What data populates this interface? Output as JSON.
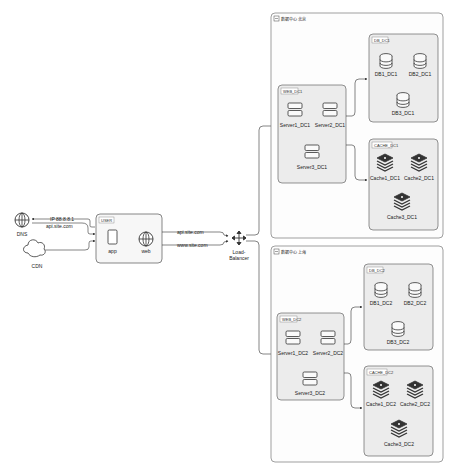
{
  "diagram": {
    "nodes": {
      "dns": {
        "label": "DNS",
        "icon": "globe-icon"
      },
      "cdn": {
        "label": "CDN",
        "icon": "cloud-icon"
      },
      "user_group": {
        "label": "USER"
      },
      "app": {
        "label": "app",
        "icon": "mobile-icon"
      },
      "web": {
        "label": "web",
        "icon": "globe-icon"
      },
      "load_balancer": {
        "label_line1": "Load-",
        "label_line2": "Balancer",
        "icon": "four-way-arrow-icon"
      }
    },
    "edges": {
      "dns_to_user": "IP 88.8.8.1",
      "user_to_dns": "api.site.com",
      "app_to_lb": "api.site.com",
      "web_to_lb": "www.site.com"
    },
    "datacenters": [
      {
        "title": "数据中心 北京",
        "db_group": {
          "label": "DB_DC1",
          "items": [
            "DB1_DC1",
            "DB2_DC1",
            "DB3_DC1"
          ]
        },
        "web_group": {
          "label": "WEB_DC1",
          "items": [
            "Server1_DC1",
            "Server2_DC1",
            "Server3_DC1"
          ]
        },
        "cache_group": {
          "label": "CACHE_DC1",
          "items": [
            "Cache1_DC1",
            "Cache2_DC1",
            "Cache3_DC1"
          ]
        }
      },
      {
        "title": "数据中心 上海",
        "db_group": {
          "label": "DB_DC2",
          "items": [
            "DB1_DC2",
            "DB2_DC2",
            "DB3_DC2"
          ]
        },
        "web_group": {
          "label": "WEB_DC2",
          "items": [
            "Server1_DC2",
            "Server2_DC2",
            "Server3_DC2"
          ]
        },
        "cache_group": {
          "label": "CACHE_DC2",
          "items": [
            "Cache1_DC2",
            "Cache2_DC2",
            "Cache3_DC2"
          ]
        }
      }
    ]
  }
}
